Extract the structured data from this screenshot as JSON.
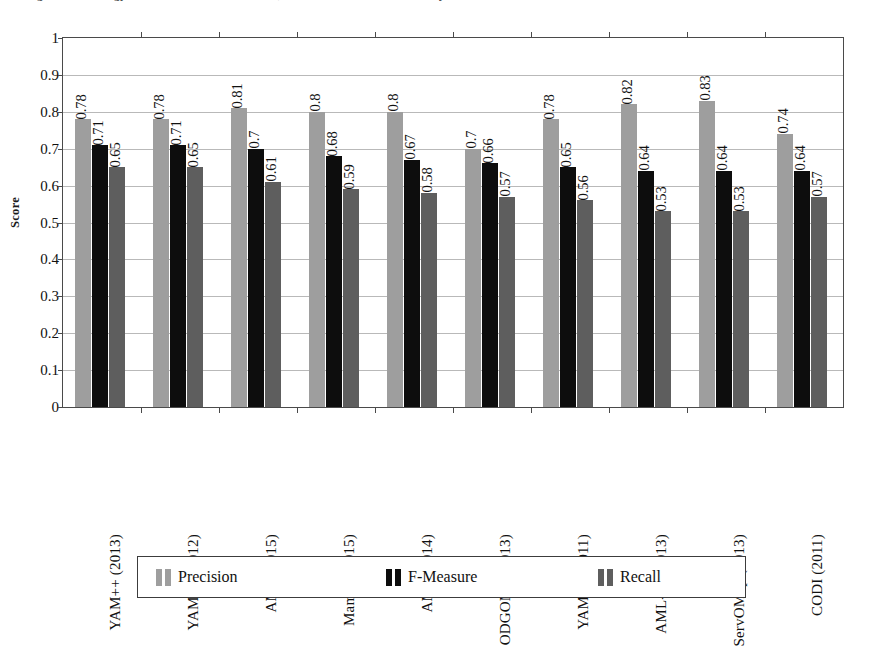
{
  "caption": {
    "text": "Figure: Technology conference results: Precision, F-Measure and Recall of the systems"
  },
  "chart_data": {
    "type": "bar",
    "title": "",
    "xlabel": "",
    "ylabel": "Score",
    "ylim": [
      0,
      1
    ],
    "ytick_step": 0.1,
    "yticks": [
      "1",
      "0.9",
      "0.8",
      "0.7",
      "0.6",
      "0.5",
      "0.4",
      "0.3",
      "0.2",
      "0.1",
      "0"
    ],
    "grid": true,
    "legend_position": "bottom",
    "categories": [
      "YAM++ (2013)",
      "YAM++ (2012)",
      "AML (2015)",
      "Mamba (2015)",
      "AML (2014)",
      "ODGOMS (2013)",
      "YAM++ (2011)",
      "AML-bk (2013)",
      "ServOMap (2013)",
      "CODI (2011)"
    ],
    "series": [
      {
        "name": "Precision",
        "color": "#9e9e9e",
        "values": [
          0.78,
          0.78,
          0.81,
          0.8,
          0.8,
          0.7,
          0.78,
          0.82,
          0.83,
          0.74
        ],
        "labels": [
          "0.78",
          "0.78",
          "0.81",
          "0.8",
          "0.8",
          "0.7",
          "0.78",
          "0.82",
          "0.83",
          "0.74"
        ]
      },
      {
        "name": "F-Measure",
        "color": "#0d0d0d",
        "values": [
          0.71,
          0.71,
          0.7,
          0.68,
          0.67,
          0.66,
          0.65,
          0.64,
          0.64,
          0.64
        ],
        "labels": [
          "0.71",
          "0.71",
          "0.7",
          "0.68",
          "0.67",
          "0.66",
          "0.65",
          "0.64",
          "0.64",
          "0.64"
        ]
      },
      {
        "name": "Recall",
        "color": "#5e5e5e",
        "values": [
          0.65,
          0.65,
          0.61,
          0.59,
          0.58,
          0.57,
          0.56,
          0.53,
          0.53,
          0.57
        ],
        "labels": [
          "0.65",
          "0.65",
          "0.61",
          "0.59",
          "0.58",
          "0.57",
          "0.56",
          "0.53",
          "0.53",
          "0.57"
        ]
      }
    ]
  },
  "legend": {
    "items": [
      {
        "label": "Precision",
        "color": "#9e9e9e"
      },
      {
        "label": "F-Measure",
        "color": "#0d0d0d"
      },
      {
        "label": "Recall",
        "color": "#5e5e5e"
      }
    ]
  }
}
